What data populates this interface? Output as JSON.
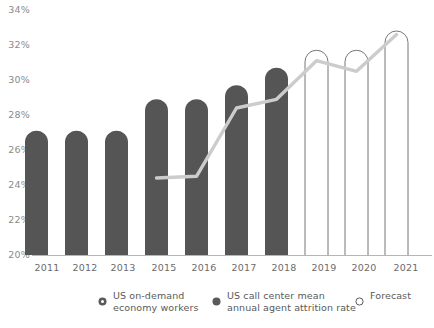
{
  "chart_data": {
    "type": "bar",
    "title": "",
    "subtitle": "",
    "xlabel": "",
    "ylabel": "",
    "grid": false,
    "ylim": [
      20,
      34
    ],
    "yticks": [
      20,
      22,
      24,
      26,
      28,
      30,
      32,
      34
    ],
    "ytick_labels": [
      "20%",
      "22%",
      "24%",
      "26%",
      "28%",
      "30%",
      "32%",
      "34%"
    ],
    "categories": [
      "2011",
      "2012",
      "2013",
      "2015",
      "2016",
      "2017",
      "2018",
      "2019",
      "2020",
      "2021"
    ],
    "legend_position": "bottom",
    "series": [
      {
        "name": "US on-demand economy workers",
        "type": "bar",
        "style": "filled",
        "color": "#555555",
        "values": [
          27.1,
          27.1,
          27.1,
          28.9,
          28.9,
          29.7,
          30.7,
          null,
          null,
          null
        ]
      },
      {
        "name": "Forecast",
        "type": "bar",
        "style": "outline",
        "color": "#777777",
        "values": [
          null,
          null,
          null,
          null,
          null,
          null,
          null,
          31.7,
          31.7,
          32.8
        ]
      },
      {
        "name": "US call center mean annual agent attrition rate",
        "type": "line",
        "color": "#cccccc",
        "values": [
          null,
          null,
          null,
          24.4,
          24.5,
          28.4,
          28.9,
          31.1,
          30.5,
          32.6
        ]
      }
    ]
  },
  "legend": {
    "items": [
      {
        "label": "US on-demand\neconomy workers",
        "marker": "donut-marker"
      },
      {
        "label": "US call center mean\nannual agent attrition rate",
        "marker": "filled-circle-marker"
      },
      {
        "label": "Forecast",
        "marker": "outline-circle-marker"
      }
    ]
  },
  "colors": {
    "bar_fill": "#555555",
    "bar_outline": "#777777",
    "line": "#cccccc",
    "axis": "#b5b5b5",
    "ytick_text": "#8a8a8a",
    "xtick_text": "#6b6b6b",
    "legend_text": "#5a5a5a"
  }
}
